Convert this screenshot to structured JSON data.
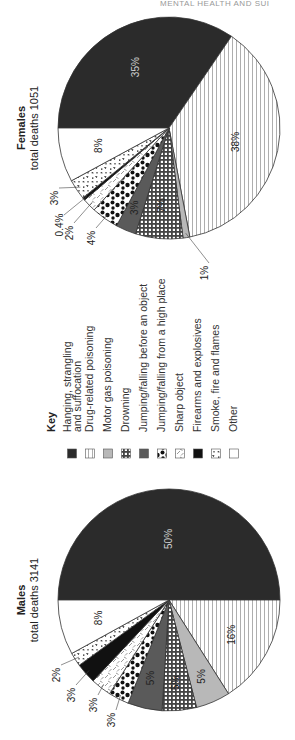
{
  "page": {
    "running_header": "MENTAL HEALTH AND SUI",
    "orientation": "rotated -90deg (text reads bottom-to-top)"
  },
  "colors": {
    "hanging": "#2b2b2b",
    "drug": "#ffffff",
    "motor_gas": "#b8b8b8",
    "drowning": "#555555",
    "jump_before": "#5a5a5a",
    "jump_high": "#ffffff",
    "sharp": "#ffffff",
    "firearms": "#111111",
    "smoke": "#ffffff",
    "other": "#ffffff",
    "stroke": "#333333",
    "pattern_ink": "#222222"
  },
  "legend": {
    "title": "Key",
    "items": [
      {
        "key": "hanging",
        "label_lines": [
          "Hanging, strangling",
          "and suffocation"
        ],
        "pattern": "solid-dark"
      },
      {
        "key": "drug",
        "label_lines": [
          "Drug-related poisoning"
        ],
        "pattern": "vertical-lines"
      },
      {
        "key": "motor_gas",
        "label_lines": [
          "Motor gas poisoning"
        ],
        "pattern": "solid-light-gray"
      },
      {
        "key": "drowning",
        "label_lines": [
          "Drowning"
        ],
        "pattern": "checkered"
      },
      {
        "key": "jump_before",
        "label_lines": [
          "Jumping/falling before an object"
        ],
        "pattern": "solid-mid-gray"
      },
      {
        "key": "jump_high",
        "label_lines": [
          "Jumping/falling from a high place"
        ],
        "pattern": "black-blotches"
      },
      {
        "key": "sharp",
        "label_lines": [
          "Sharp object"
        ],
        "pattern": "scattered-dashes"
      },
      {
        "key": "firearms",
        "label_lines": [
          "Firearms and explosives"
        ],
        "pattern": "solid-black"
      },
      {
        "key": "smoke",
        "label_lines": [
          "Smoke, fire and flames"
        ],
        "pattern": "speckled"
      },
      {
        "key": "other",
        "label_lines": [
          "Other"
        ],
        "pattern": "white"
      }
    ]
  },
  "chart_data": [
    {
      "type": "pie",
      "title": "Females",
      "subtitle": "total deaths 1051",
      "categories": [
        "Hanging, strangling and suffocation",
        "Drug-related poisoning",
        "Motor gas poisoning",
        "Drowning",
        "Jumping/falling before an object",
        "Jumping/falling from a high place",
        "Sharp object",
        "Firearms and explosives",
        "Smoke, fire and flames",
        "Other"
      ],
      "keys": [
        "hanging",
        "drug",
        "motor_gas",
        "drowning",
        "jump_before",
        "jump_high",
        "sharp",
        "firearms",
        "smoke",
        "other"
      ],
      "values": [
        35,
        38,
        1,
        7,
        3,
        4,
        2,
        0.4,
        3,
        8
      ],
      "labels": [
        "35%",
        "38%",
        "1%",
        "7%",
        "3%",
        "4%",
        "2%",
        "0.4%",
        "3%",
        "8%"
      ],
      "unit": "%",
      "start_angle": "9 o'clock, clockwise (in rotated image)"
    },
    {
      "type": "pie",
      "title": "Males",
      "subtitle": "total deaths 3141",
      "categories": [
        "Hanging, strangling and suffocation",
        "Drug-related poisoning",
        "Motor gas poisoning",
        "Drowning",
        "Jumping/falling before an object",
        "Jumping/falling from a high place",
        "Sharp object",
        "Firearms and explosives",
        "Smoke, fire and flames",
        "Other"
      ],
      "keys": [
        "hanging",
        "drug",
        "motor_gas",
        "drowning",
        "jump_before",
        "jump_high",
        "sharp",
        "firearms",
        "smoke",
        "other"
      ],
      "values": [
        50,
        16,
        5,
        5,
        5,
        3,
        3,
        3,
        2,
        8
      ],
      "labels": [
        "50%",
        "16%",
        "5%",
        "5%",
        "5%",
        "3%",
        "3%",
        "3%",
        "2%",
        "8%"
      ],
      "unit": "%",
      "start_angle": "9 o'clock, clockwise (in rotated image)"
    }
  ],
  "layout": {
    "female": {
      "cx": 169,
      "cy": 128,
      "r": 111,
      "title_x": 22,
      "title_y": 128,
      "label_pos": {
        "hanging": {
          "mode": "inside",
          "dist": 0.62,
          "light": true
        },
        "drug": {
          "mode": "inside",
          "dist": 0.62
        },
        "motor_gas": {
          "mode": "leader",
          "tx": 205,
          "ty": 273
        },
        "drowning": {
          "mode": "inside",
          "dist": 0.7
        },
        "jump_before": {
          "mode": "inside",
          "dist": 0.78
        },
        "jump_high": {
          "mode": "leader",
          "tx": 92,
          "ty": 238
        },
        "sharp": {
          "mode": "leader",
          "tx": 70,
          "ty": 233
        },
        "firearms": {
          "mode": "leader",
          "tx": 60,
          "ty": 225
        },
        "smoke": {
          "mode": "leader",
          "tx": 55,
          "ty": 198
        },
        "other": {
          "mode": "inside",
          "dist": 0.65
        }
      }
    },
    "male": {
      "cx": 169,
      "cy": 600,
      "r": 111,
      "title_x": 22,
      "title_y": 600,
      "label_pos": {
        "hanging": {
          "mode": "inside",
          "dist": 0.55,
          "light": true
        },
        "drug": {
          "mode": "inside",
          "dist": 0.65
        },
        "motor_gas": {
          "mode": "inside",
          "dist": 0.75
        },
        "drowning": {
          "mode": "inside",
          "dist": 0.75
        },
        "jump_before": {
          "mode": "inside",
          "dist": 0.72
        },
        "jump_high": {
          "mode": "leader",
          "tx": 112,
          "ty": 720
        },
        "sharp": {
          "mode": "leader",
          "tx": 94,
          "ty": 705
        },
        "firearms": {
          "mode": "leader",
          "tx": 72,
          "ty": 695
        },
        "smoke": {
          "mode": "leader",
          "tx": 57,
          "ty": 675
        },
        "other": {
          "mode": "inside",
          "dist": 0.65
        }
      }
    },
    "legend": {
      "key_x": 52,
      "text_base_y": 432,
      "swatch_y": 449,
      "swatch_size": 9,
      "columns": [
        72,
        90,
        108,
        126,
        144,
        162,
        180,
        198,
        216,
        234
      ]
    }
  }
}
